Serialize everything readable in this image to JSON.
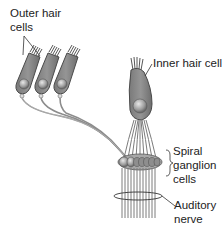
{
  "diagram": {
    "labels": {
      "outer_hair_cells": "Outer hair\ncells",
      "inner_hair_cell": "Inner hair cell",
      "spiral_ganglion_cells": "Spiral\nganglion\ncells",
      "auditory_nerve": "Auditory\nnerve"
    },
    "colors": {
      "cell_body": "#8a8a8a",
      "cell_outline": "#4a4a4a",
      "nucleus": "#b5b5b5",
      "fiber": "#9a9a9a",
      "stereocilia": "#555555",
      "text": "#222222"
    }
  }
}
